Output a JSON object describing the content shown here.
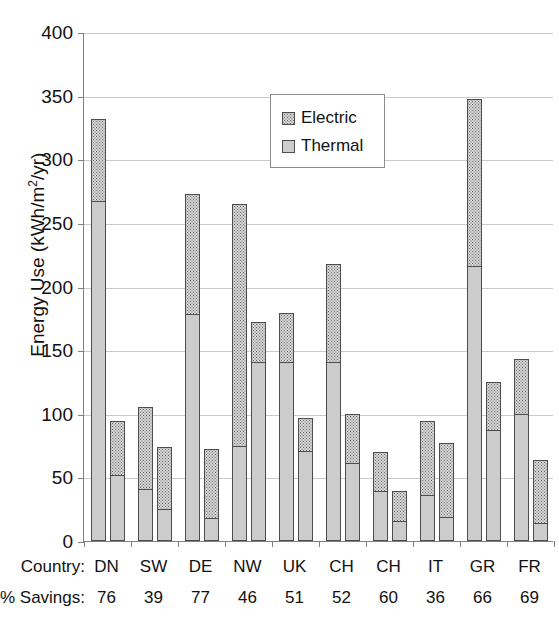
{
  "chart_data": {
    "type": "bar",
    "stacked": true,
    "title": "",
    "xlabel": "",
    "ylabel": "Energy Use (kWh/m²/yr)",
    "ylim": [
      0,
      400
    ],
    "yticks": [
      0,
      50,
      100,
      150,
      200,
      250,
      300,
      350,
      400
    ],
    "ytick_labels": [
      "0",
      "50",
      "100",
      "150",
      "200",
      "250",
      "300",
      "350",
      "400"
    ],
    "grid": true,
    "legend": {
      "position": "upper-left-inside",
      "entries": [
        {
          "label": "Electric",
          "pattern": "dotted",
          "color": "#d6d6d6"
        },
        {
          "label": "Thermal",
          "pattern": "solid",
          "color": "#cccccc"
        }
      ]
    },
    "categories": [
      "DN",
      "SW",
      "DE",
      "NW",
      "UK",
      "CH",
      "CH",
      "IT",
      "GR",
      "FR"
    ],
    "bars_per_category": 2,
    "bar_names": [
      "existing",
      "retrofit"
    ],
    "series": [
      {
        "name": "Thermal",
        "values": [
          [
            267,
            52
          ],
          [
            41,
            25
          ],
          [
            178,
            18
          ],
          [
            75,
            141
          ],
          [
            141,
            71
          ],
          [
            141,
            61
          ],
          [
            39,
            16
          ],
          [
            36,
            19
          ],
          [
            216,
            87
          ],
          [
            100,
            14
          ]
        ]
      },
      {
        "name": "Electric",
        "values": [
          [
            65,
            42
          ],
          [
            64,
            49
          ],
          [
            95,
            54
          ],
          [
            190,
            31
          ],
          [
            38,
            26
          ],
          [
            77,
            39
          ],
          [
            31,
            23
          ],
          [
            58,
            58
          ],
          [
            131,
            38
          ],
          [
            43,
            50
          ]
        ]
      }
    ],
    "totals": [
      [
        332,
        94
      ],
      [
        105,
        74
      ],
      [
        273,
        72
      ],
      [
        265,
        172
      ],
      [
        179,
        97
      ],
      [
        218,
        100
      ],
      [
        70,
        39
      ],
      [
        94,
        77
      ],
      [
        347,
        125
      ],
      [
        143,
        64
      ]
    ],
    "annotations": {
      "country_row_label": "Country:",
      "savings_row_label": "% Savings:",
      "savings_values": [
        76,
        39,
        77,
        46,
        51,
        52,
        60,
        36,
        66,
        69
      ]
    }
  }
}
